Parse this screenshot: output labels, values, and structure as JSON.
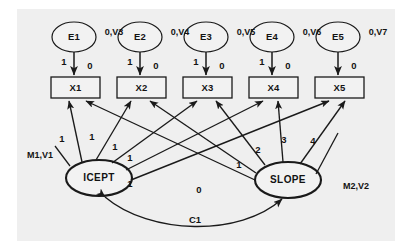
{
  "figure": {
    "type": "sem-path-diagram",
    "plate_bg": "#efefef",
    "page_bg": "#ffffff",
    "stroke": "#1a1a1a",
    "node_fill": "#f2f2f2"
  },
  "residuals": [
    {
      "id": "E1",
      "label": "E1",
      "param": "0,V3",
      "loading": "1",
      "intercept": "0"
    },
    {
      "id": "E2",
      "label": "E2",
      "param": "0,V4",
      "loading": "1",
      "intercept": "0"
    },
    {
      "id": "E3",
      "label": "E3",
      "param": "0,V5",
      "loading": "1",
      "intercept": "0"
    },
    {
      "id": "E4",
      "label": "E4",
      "param": "0,V6",
      "loading": "1",
      "intercept": "0"
    },
    {
      "id": "E5",
      "label": "E5",
      "param": "0,V7",
      "loading": "",
      "intercept": "0"
    }
  ],
  "indicators": [
    {
      "id": "X1",
      "label": "X1"
    },
    {
      "id": "X2",
      "label": "X2"
    },
    {
      "id": "X3",
      "label": "X3"
    },
    {
      "id": "X4",
      "label": "X4"
    },
    {
      "id": "X5",
      "label": "X5"
    }
  ],
  "latents": [
    {
      "id": "ICEPT",
      "label": "ICEPT",
      "param": "M1,V1"
    },
    {
      "id": "SLOPE",
      "label": "SLOPE",
      "param": "M2,V2"
    }
  ],
  "intercept_loadings": [
    {
      "from": "ICEPT",
      "to": "X1",
      "weight": "1"
    },
    {
      "from": "ICEPT",
      "to": "X2",
      "weight": "1"
    },
    {
      "from": "ICEPT",
      "to": "X3",
      "weight": "1"
    },
    {
      "from": "ICEPT",
      "to": "X4",
      "weight": "1"
    },
    {
      "from": "ICEPT",
      "to": "X5",
      "weight": "1"
    }
  ],
  "slope_loadings": [
    {
      "from": "SLOPE",
      "to": "X1",
      "weight": "0"
    },
    {
      "from": "SLOPE",
      "to": "X2",
      "weight": "1"
    },
    {
      "from": "SLOPE",
      "to": "X3",
      "weight": "2"
    },
    {
      "from": "SLOPE",
      "to": "X4",
      "weight": "3"
    },
    {
      "from": "SLOPE",
      "to": "X5",
      "weight": "4"
    }
  ],
  "covariance": {
    "between": [
      "ICEPT",
      "SLOPE"
    ],
    "label": "C1"
  }
}
